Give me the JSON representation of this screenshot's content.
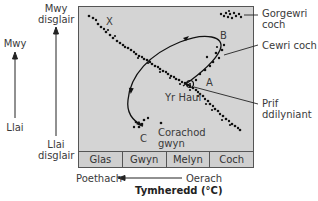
{
  "left_axis": {
    "luminosity_top": "Mwy",
    "luminosity_bottom": "Llai",
    "brightness_top": "Mwy disglair",
    "brightness_bottom": "Llai disglair"
  },
  "regions": {
    "giants_super": "Gorgewri coch",
    "giants_red": "Cewri coch",
    "main_sequence": "Prif ddilyniant",
    "white_dwarfs": "Corachod gwyn",
    "sun": "Yr Haul"
  },
  "points": {
    "X": "X",
    "A": "A",
    "B": "B",
    "C": "C"
  },
  "color_band": [
    "Glas",
    "Gwyn",
    "Melyn",
    "Coch"
  ],
  "bottom_axis": {
    "hotter": "Poethach",
    "cooler": "Oerach",
    "title": "Tymheredd (°C)"
  },
  "colors": {
    "plot_bg": "#d4d4d4",
    "dots": "#111111",
    "line": "#222222"
  }
}
